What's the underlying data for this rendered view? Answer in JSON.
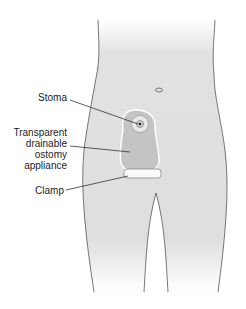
{
  "diagram": {
    "labels": {
      "stoma": "Stoma",
      "appliance_line1": "Transparent",
      "appliance_line2": "drainable",
      "appliance_line3": "ostomy",
      "appliance_line4": "appliance",
      "clamp": "Clamp"
    },
    "colors": {
      "skin": "#dcdcdc",
      "outline": "#555555",
      "appliance": "#bdbdbd",
      "leader": "#333333"
    }
  }
}
